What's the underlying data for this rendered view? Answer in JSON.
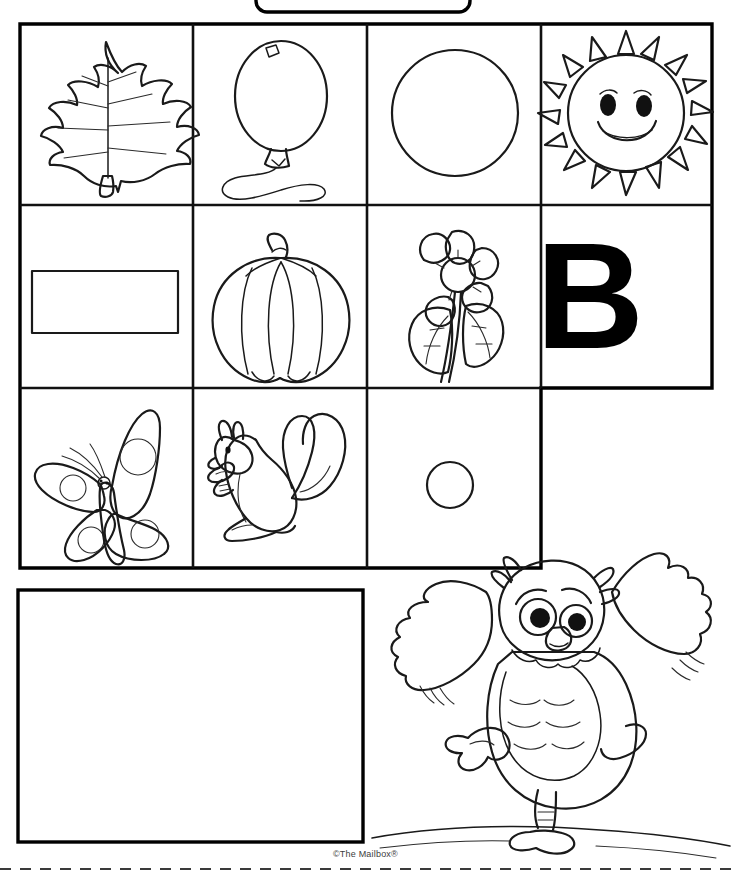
{
  "page": {
    "width": 735,
    "height": 875,
    "background_color": "#ffffff",
    "ink_color": "#111111"
  },
  "name_box": {
    "name": "name-box",
    "label": "",
    "shape": "rounded-rectangle",
    "note": "partially cropped at top edge of page"
  },
  "picture_grid": {
    "name": "picture-grid",
    "rows": 3,
    "columns": 4,
    "note": "row 3 has only 3 cells; the fourth position is absent",
    "cells": [
      {
        "row": 1,
        "column": 1,
        "icon": "leaf-icon",
        "label": "leaf",
        "starts_with_b": false
      },
      {
        "row": 1,
        "column": 2,
        "icon": "balloon-icon",
        "label": "balloon",
        "starts_with_b": true
      },
      {
        "row": 1,
        "column": 3,
        "icon": "circle-icon",
        "label": "circle",
        "starts_with_b": false
      },
      {
        "row": 1,
        "column": 4,
        "icon": "sun-icon",
        "label": "sun",
        "starts_with_b": false
      },
      {
        "row": 2,
        "column": 1,
        "icon": "rectangle-icon",
        "label": "rectangle",
        "starts_with_b": false
      },
      {
        "row": 2,
        "column": 2,
        "icon": "pumpkin-icon",
        "label": "pumpkin",
        "starts_with_b": false
      },
      {
        "row": 2,
        "column": 3,
        "icon": "flower-icon",
        "label": "flower",
        "starts_with_b": false
      },
      {
        "row": 2,
        "column": 4,
        "icon": "letter-b-icon",
        "label": "B",
        "starts_with_b": true
      },
      {
        "row": 3,
        "column": 1,
        "icon": "butterfly-icon",
        "label": "butterfly",
        "starts_with_b": true
      },
      {
        "row": 3,
        "column": 2,
        "icon": "squirrel-icon",
        "label": "squirrel",
        "starts_with_b": false
      },
      {
        "row": 3,
        "column": 3,
        "icon": "small-circle-icon",
        "label": "small circle",
        "starts_with_b": false
      }
    ]
  },
  "letter_cell": {
    "name": "letter-b-cell",
    "letter": "B"
  },
  "answer_box": {
    "name": "answer-box",
    "content": "",
    "placeholder": ""
  },
  "owl": {
    "name": "owl-illustration",
    "label": "owl",
    "description": "cartoon owl with wings spread walking on ground line"
  },
  "footer": {
    "credit": "©The Mailbox®",
    "cut_line": "dashed-cut-line"
  }
}
